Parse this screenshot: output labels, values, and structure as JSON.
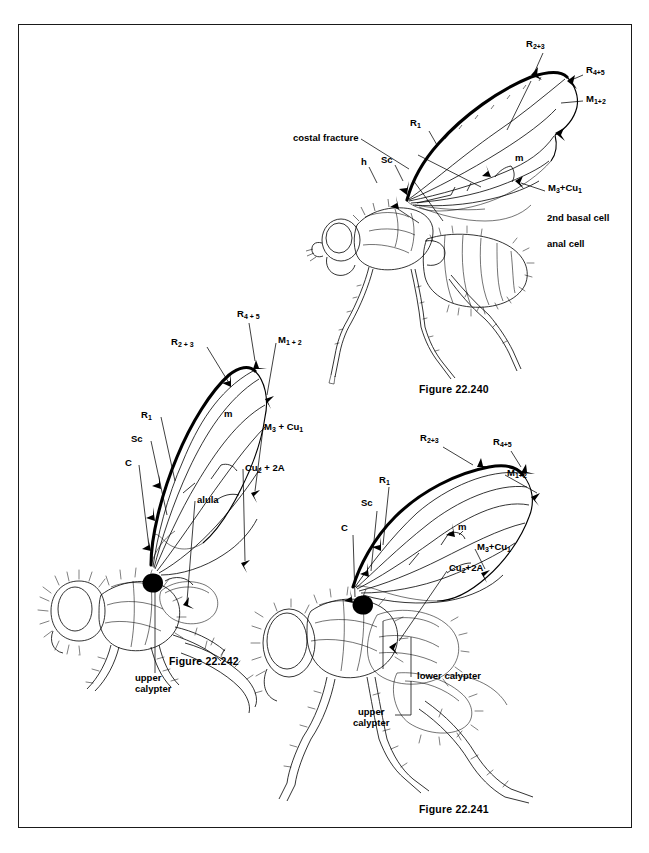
{
  "page": {
    "background_color": "#ffffff",
    "frame_color": "#1a1a1a",
    "ink_color": "#000000"
  },
  "figures": [
    {
      "id": "fig-22-240",
      "caption": "Figure 22.240",
      "subject": "fly-lateral-habitus-with-wing-venation",
      "labels": [
        {
          "name": "vein-r2-3",
          "text": "R2+3",
          "base": "R",
          "sub": "2+3"
        },
        {
          "name": "vein-r4-5",
          "text": "R4+5",
          "base": "R",
          "sub": "4+5"
        },
        {
          "name": "vein-m1-2",
          "text": "M1+2",
          "base": "M",
          "sub": "1+2"
        },
        {
          "name": "vein-m3-cu1",
          "text": "M3+Cu1",
          "base": "M",
          "sub": "3"
        },
        {
          "name": "crossvein-m",
          "text": "m"
        },
        {
          "name": "vein-r1",
          "text": "R1",
          "base": "R",
          "sub": "1"
        },
        {
          "name": "vein-sc",
          "text": "Sc"
        },
        {
          "name": "humeral-crossvein",
          "text": "h"
        },
        {
          "name": "costal-fracture",
          "text": "costal fracture"
        },
        {
          "name": "second-basal-cell",
          "text": "2nd basal cell"
        },
        {
          "name": "anal-cell",
          "text": "anal cell"
        }
      ]
    },
    {
      "id": "fig-22-242",
      "caption": "Figure 22.242",
      "subject": "hairy-fly-lateral-habitus-with-wing-venation",
      "labels": [
        {
          "name": "vein-r4-5",
          "text": "R4+5",
          "base": "R",
          "sub": "4 + 5"
        },
        {
          "name": "vein-r2-3",
          "text": "R2+3",
          "base": "R",
          "sub": "2 + 3"
        },
        {
          "name": "vein-m1-2",
          "text": "M1+2",
          "base": "M",
          "sub": "1 + 2"
        },
        {
          "name": "vein-r1",
          "text": "R1",
          "base": "R",
          "sub": "1"
        },
        {
          "name": "vein-sc",
          "text": "Sc"
        },
        {
          "name": "vein-c",
          "text": "C"
        },
        {
          "name": "crossvein-m",
          "text": "m"
        },
        {
          "name": "vein-m3-cu1",
          "text": "M3 + Cu1",
          "base": "M",
          "sub": "3"
        },
        {
          "name": "vein-cu2-2a",
          "text": "Cu2 + 2A",
          "base": "Cu",
          "sub": "2"
        },
        {
          "name": "alula",
          "text": "alula"
        },
        {
          "name": "upper-calypter",
          "text": "upper\ncalypter",
          "line1": "upper",
          "line2": "calypter"
        }
      ]
    },
    {
      "id": "fig-22-241",
      "caption": "Figure 22.241",
      "subject": "fly-lateral-habitus-with-calypters",
      "labels": [
        {
          "name": "vein-r2-3",
          "text": "R2+3",
          "base": "R",
          "sub": "2+3"
        },
        {
          "name": "vein-r4-5",
          "text": "R4+5",
          "base": "R",
          "sub": "4+5"
        },
        {
          "name": "vein-m1-2",
          "text": "M1+2",
          "base": "M",
          "sub": "1+2"
        },
        {
          "name": "vein-r1",
          "text": "R1",
          "base": "R",
          "sub": "1"
        },
        {
          "name": "vein-sc",
          "text": "Sc"
        },
        {
          "name": "vein-c",
          "text": "C"
        },
        {
          "name": "crossvein-m",
          "text": "m"
        },
        {
          "name": "vein-m3-cu1",
          "text": "M3+Cu1",
          "base": "M",
          "sub": "3"
        },
        {
          "name": "vein-cu2-2a",
          "text": "Cu2+2A",
          "base": "Cu",
          "sub": "2"
        },
        {
          "name": "lower-calypter",
          "text": "lower calypter"
        },
        {
          "name": "upper-calypter",
          "text": "upper\ncalypter",
          "line1": "upper",
          "line2": "calypter"
        }
      ]
    }
  ]
}
